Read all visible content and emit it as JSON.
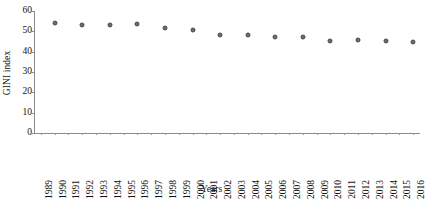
{
  "chart_data": {
    "type": "scatter",
    "title": "",
    "xlabel": "Years",
    "ylabel": "GINI index",
    "ylim": [
      0,
      60
    ],
    "yticks": [
      0,
      10,
      20,
      30,
      40,
      50,
      60
    ],
    "grid": false,
    "legend": null,
    "marker": "filled-circle-gray",
    "xtick_labels": [
      "1989",
      "1990",
      "1991",
      "1992",
      "1993",
      "1994",
      "1995",
      "1996",
      "1997",
      "1998",
      "1999",
      "2000",
      "2001",
      "2002",
      "2003",
      "2004",
      "2005",
      "2006",
      "2007",
      "2008",
      "2009",
      "2010",
      "2011",
      "2012",
      "2013",
      "2014",
      "2015",
      "2016"
    ],
    "xlim": [
      "1989",
      "2016"
    ],
    "points": [
      {
        "x": "1990",
        "y": 54.2
      },
      {
        "x": "1992",
        "y": 52.9
      },
      {
        "x": "1994",
        "y": 53.1
      },
      {
        "x": "1996",
        "y": 53.5
      },
      {
        "x": "1998",
        "y": 51.7
      },
      {
        "x": "2000",
        "y": 50.6
      },
      {
        "x": "2002",
        "y": 48.3
      },
      {
        "x": "2004",
        "y": 48.2
      },
      {
        "x": "2006",
        "y": 47.0
      },
      {
        "x": "2008",
        "y": 47.3
      },
      {
        "x": "2010",
        "y": 45.3
      },
      {
        "x": "2012",
        "y": 45.5
      },
      {
        "x": "2014",
        "y": 45.4
      },
      {
        "x": "2016",
        "y": 44.7
      }
    ]
  },
  "colors": {
    "marker_fill": "#6b6b6b",
    "marker_edge": "#4a4a4a",
    "axis": "#8a8a8a",
    "text": "#111111",
    "background": "#ffffff"
  }
}
